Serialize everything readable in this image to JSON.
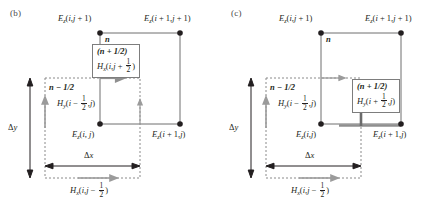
{
  "figure": {
    "type": "yee-cell-fdtd-update-diagram",
    "panels": [
      {
        "id": "b",
        "label": "(b)",
        "nodes": [
          {
            "name": "top-left",
            "label_html": "E<sub>z</sub>(i,j + 1)",
            "text": "Ez(i,j + 1)",
            "x": 100,
            "y": 33
          },
          {
            "name": "top-right",
            "label_html": "E<sub>z</sub>(i + 1,j + 1)",
            "text": "Ez(i + 1,j + 1)",
            "x": 180,
            "y": 33
          },
          {
            "name": "bottom-left",
            "label_html": "E<sub>z</sub>(i, j)",
            "text": "Ez(i, j)",
            "x": 100,
            "y": 124
          },
          {
            "name": "bottom-right",
            "label_html": "E<sub>z</sub>(i + 1,j)",
            "text": "Ez(i + 1,j)",
            "x": 180,
            "y": 124
          }
        ],
        "time_labels": [
          {
            "name": "n-label",
            "text": "n",
            "x": 104,
            "y": 35
          },
          {
            "name": "n-minus-half",
            "text": "n − 1/2",
            "x": 45,
            "y": 80
          }
        ],
        "boxed_annotation": {
          "name": "h-field-update-box",
          "line1": "(n + 1/2)",
          "line2_base": "Hx(i,j + ",
          "line2_frac_num": "1",
          "line2_frac_den": "2",
          "line2_tail": ")",
          "field": "Hx",
          "args": "i, j + 1/2",
          "time_level": "n + 1/2"
        },
        "side_annotation": {
          "name": "hy-left-label",
          "field": "Hy",
          "base": "Hy(i − ",
          "frac_num": "1",
          "frac_den": "2",
          "tail": ",j)",
          "time_level": "n − 1/2"
        },
        "bottom_annotation": {
          "name": "hx-bottom-label",
          "field": "Hx",
          "base": "Hx(i,j − ",
          "frac_num": "1",
          "frac_den": "2",
          "tail": ")"
        },
        "dimensions": [
          {
            "name": "delta-y",
            "text": "Δy",
            "orientation": "vertical"
          },
          {
            "name": "delta-x",
            "text": "Δx",
            "orientation": "horizontal"
          }
        ],
        "highlight": "Hx at (i, j+1/2) is updated — horizontal magnetic field above the cell"
      },
      {
        "id": "c",
        "label": "(c)",
        "nodes": [
          {
            "name": "top-left",
            "label_html": "E<sub>z</sub>(i,j + 1)",
            "text": "Ez(i,j + 1)",
            "x": 100,
            "y": 33
          },
          {
            "name": "top-right",
            "label_html": "E<sub>z</sub>(i + 1,j + 1)",
            "text": "Ez(i + 1,j + 1)",
            "x": 180,
            "y": 33
          },
          {
            "name": "bottom-left",
            "label_html": "E<sub>z</sub>(i,j)",
            "text": "Ez(i,j)",
            "x": 100,
            "y": 124
          },
          {
            "name": "bottom-right",
            "label_html": "E<sub>z</sub>(i + 1,j)",
            "text": "Ez(i + 1,j)",
            "x": 180,
            "y": 124
          }
        ],
        "time_labels": [
          {
            "name": "n-label",
            "text": "n",
            "x": 104,
            "y": 35
          },
          {
            "name": "n-minus-half",
            "text": "n − 1/2",
            "x": 45,
            "y": 80
          }
        ],
        "boxed_annotation": {
          "name": "h-field-update-box",
          "line1": "(n + 1/2)",
          "line2_base": "Hy(i + ",
          "line2_frac_num": "1",
          "line2_frac_den": "2",
          "line2_tail": ",j)",
          "field": "Hy",
          "args": "i + 1/2, j",
          "time_level": "n + 1/2"
        },
        "side_annotation": {
          "name": "hy-left-label",
          "field": "Hy",
          "base": "Hy(i − ",
          "frac_num": "1",
          "frac_den": "2",
          "tail": ",j)",
          "time_level": "n − 1/2"
        },
        "bottom_annotation": {
          "name": "hx-bottom-label",
          "field": "Hx",
          "base": "Hx(i,j − ",
          "frac_num": "1",
          "frac_den": "2",
          "tail": ")"
        },
        "dimensions": [
          {
            "name": "delta-y",
            "text": "Δy",
            "orientation": "vertical"
          },
          {
            "name": "delta-x",
            "text": "Δx",
            "orientation": "horizontal"
          }
        ],
        "highlight": "Hy at (i+1/2, j) is updated — vertical magnetic field right of the cell"
      }
    ],
    "colors": {
      "ink": "#231f20",
      "grid_line": "#6e6e6e",
      "dashed_box": "#8a8a8a",
      "highlight_arrow": "#8f8f8f",
      "box_border": "#7d7d7d",
      "node_fill": "#231f20",
      "background": "#ffffff"
    },
    "glyphs": {
      "delta": "Δ",
      "minus": "−"
    }
  }
}
